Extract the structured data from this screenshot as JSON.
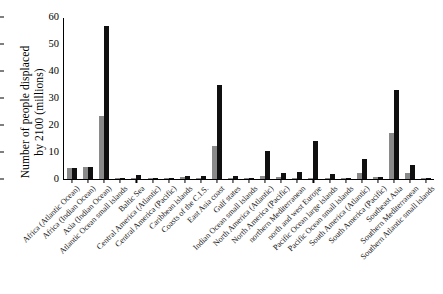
{
  "chart_data": {
    "type": "bar",
    "title": "",
    "xlabel": "",
    "ylabel": "Number of people displaced by 2100 (millions)",
    "ylabel_lines": [
      "Number of people displaced",
      "by 2100 (millions)"
    ],
    "ylim": [
      0,
      60
    ],
    "yticks": [
      0,
      10,
      20,
      30,
      40,
      50,
      60
    ],
    "ytick_labels": [
      "0",
      "10",
      "20",
      "30",
      "40",
      "50",
      "60"
    ],
    "grid": false,
    "legend_position": "none",
    "categories": [
      "Africa (Atlantic Ocean)",
      "Africa (Indian Ocean)",
      "Asia (Indian Ocean)",
      "Atlantic Ocean small islands",
      "Baltic Sea",
      "Central America (Atlantic)",
      "Central America (Pacific)",
      "Caribbean islands",
      "Coasts of the C.I.S.",
      "East Asia coast",
      "Gulf states",
      "Indian Ocean small islands",
      "North America (Atlantic)",
      "North America (Pacific)",
      "northern Mediterranean",
      "north and west Europe",
      "Pacific Ocean large islands",
      "Pacific Ocean small islands",
      "South America (Atlantic)",
      "South America (Pacific)",
      "Southeast Asia",
      "Southern Mediterranean",
      "Southern Atlantic small islands"
    ],
    "series": [
      {
        "name": "grey",
        "color": "#8a8a8a",
        "values": [
          4.0,
          4.5,
          23.2,
          0.1,
          0.5,
          0.2,
          0.1,
          0.7,
          0.5,
          12.4,
          0.5,
          0.3,
          1.2,
          0.8,
          0.4,
          0.3,
          0.2,
          0.3,
          2.2,
          0.8,
          17.0,
          2.3,
          0.1
        ]
      },
      {
        "name": "black",
        "color": "#101010",
        "values": [
          4.0,
          4.5,
          56.6,
          0.2,
          1.6,
          0.2,
          0.1,
          1.1,
          1.0,
          34.8,
          1.0,
          0.5,
          10.5,
          2.1,
          2.5,
          14.2,
          2.0,
          0.3,
          7.4,
          0.8,
          33.0,
          5.2,
          0.1
        ]
      }
    ]
  }
}
